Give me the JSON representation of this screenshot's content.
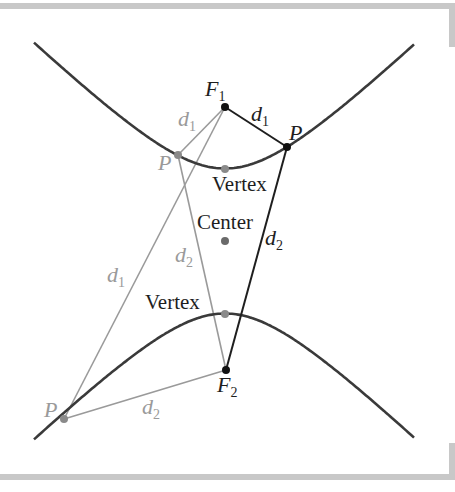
{
  "colors": {
    "curve": "#3a3a3a",
    "dark_line": "#1e1e1e",
    "gray_line": "#9a9a9a",
    "gray_text": "#9a9a9a",
    "dark_text": "#1e1e1e",
    "frame": "#c8c8c8",
    "focus_point": "#111111",
    "gray_point": "#8a8a8a"
  },
  "hyperbola": {
    "center": [
      225,
      241
    ],
    "a": 72.5,
    "b": 75,
    "x_range": [
      34,
      414
    ]
  },
  "points": {
    "F1": {
      "x": 225,
      "y": 107
    },
    "F2": {
      "x": 226,
      "y": 370
    },
    "P_right": {
      "x": 287,
      "y": 147
    },
    "P_upper_left": {
      "x": 178,
      "y": 155
    },
    "P_lower_left": {
      "x": 64,
      "y": 419
    },
    "vertex_top": {
      "x": 225,
      "y": 169
    },
    "vertex_bottom": {
      "x": 225,
      "y": 314
    },
    "center": {
      "x": 225,
      "y": 241
    }
  },
  "labels": {
    "F1": {
      "main": "F",
      "sub": "1"
    },
    "F2": {
      "main": "F",
      "sub": "2"
    },
    "d1": {
      "main": "d",
      "sub": "1"
    },
    "d2": {
      "main": "d",
      "sub": "2"
    },
    "P": "P",
    "vertex": "Vertex",
    "center": "Center"
  }
}
